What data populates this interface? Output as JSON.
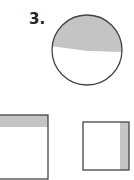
{
  "problem": {
    "number_label": "3."
  },
  "colors": {
    "shade": "#c4c4c4",
    "stroke": "#444444",
    "background": "#ffffff"
  },
  "figures": [
    {
      "shape": "circle",
      "shaded_region": "top portion"
    },
    {
      "shape": "rectangle",
      "shaded_region": "top strip"
    },
    {
      "shape": "square",
      "shaded_region": "right strip"
    }
  ]
}
